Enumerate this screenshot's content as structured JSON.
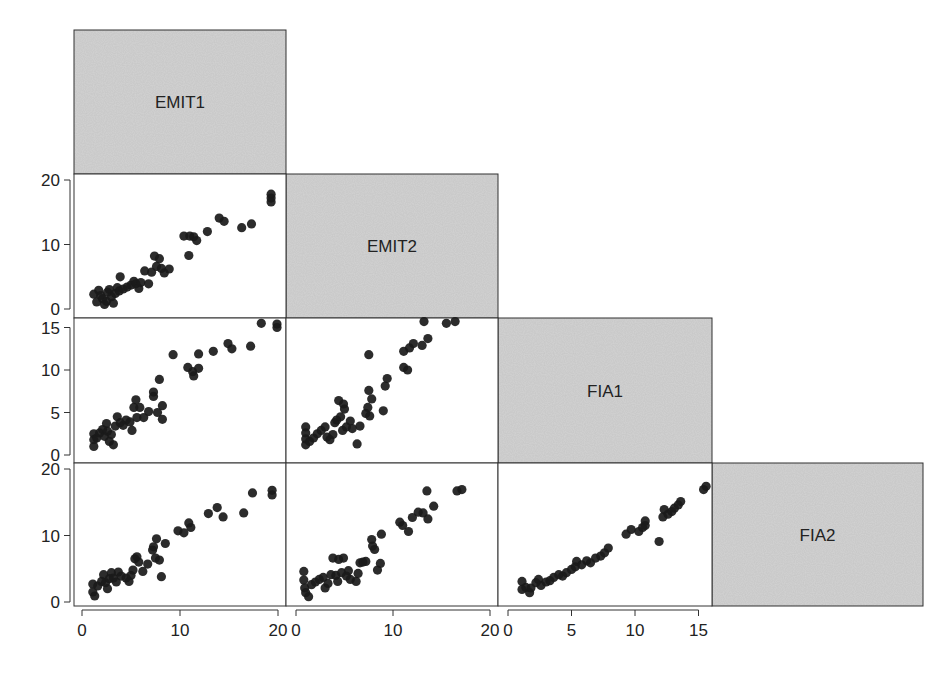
{
  "chart_data": {
    "type": "scatter",
    "title": "",
    "layout": "lower-triangular scatterplot matrix",
    "variables": [
      "EMIT1",
      "EMIT2",
      "FIA1",
      "FIA2"
    ],
    "diagonal_labels": [
      "EMIT1",
      "EMIT2",
      "FIA1",
      "FIA2"
    ],
    "colors": {
      "diagonal_fill": "#d4d4d4",
      "point": "#1a1a1a",
      "frame": "#333333"
    },
    "axes": {
      "EMIT1": {
        "range": [
          0,
          20
        ],
        "ticks": [
          0,
          10,
          20
        ]
      },
      "EMIT2": {
        "range": [
          0,
          20
        ],
        "ticks": [
          0,
          10,
          20
        ]
      },
      "FIA1": {
        "range": [
          0,
          15
        ],
        "ticks": [
          0,
          5,
          10,
          15
        ]
      },
      "FIA2": {
        "range": [
          0,
          20
        ],
        "ticks": [
          0,
          10,
          20
        ]
      }
    },
    "x_tick_labels": [
      [
        "0",
        "10",
        "20"
      ],
      [
        "0",
        "10",
        "20"
      ],
      [
        "0",
        "5",
        "10",
        "15"
      ]
    ],
    "y_tick_labels": [
      [
        "0",
        "10",
        "20"
      ],
      [
        "0",
        "5",
        "10",
        "15"
      ],
      [
        "0",
        "10",
        "20"
      ]
    ],
    "panels": [
      {
        "x": "EMIT1",
        "y": "EMIT2",
        "row": 1,
        "col": 0,
        "points": [
          [
            1.2,
            2.3
          ],
          [
            1.5,
            1.1
          ],
          [
            1.7,
            2.9
          ],
          [
            1.9,
            2.1
          ],
          [
            2.1,
            1.6
          ],
          [
            2.3,
            0.7
          ],
          [
            2.5,
            1.2
          ],
          [
            2.6,
            2.6
          ],
          [
            2.8,
            3.0
          ],
          [
            3.0,
            1.9
          ],
          [
            3.2,
            0.9
          ],
          [
            3.4,
            2.4
          ],
          [
            3.6,
            3.3
          ],
          [
            3.8,
            2.8
          ],
          [
            3.9,
            5.0
          ],
          [
            4.2,
            3.1
          ],
          [
            4.6,
            3.4
          ],
          [
            5.0,
            3.7
          ],
          [
            5.3,
            4.3
          ],
          [
            5.5,
            3.9
          ],
          [
            5.8,
            3.2
          ],
          [
            6.0,
            4.1
          ],
          [
            6.4,
            5.9
          ],
          [
            6.8,
            3.9
          ],
          [
            7.1,
            5.7
          ],
          [
            7.4,
            8.2
          ],
          [
            7.6,
            6.6
          ],
          [
            7.9,
            7.8
          ],
          [
            8.1,
            6.3
          ],
          [
            8.4,
            5.6
          ],
          [
            8.9,
            6.2
          ],
          [
            10.4,
            11.3
          ],
          [
            10.9,
            8.3
          ],
          [
            11.0,
            11.3
          ],
          [
            11.4,
            11.2
          ],
          [
            11.7,
            10.6
          ],
          [
            12.8,
            12.0
          ],
          [
            14.0,
            14.1
          ],
          [
            14.5,
            13.6
          ],
          [
            16.3,
            12.6
          ],
          [
            17.3,
            13.2
          ],
          [
            19.3,
            17.8
          ],
          [
            19.3,
            17.2
          ],
          [
            19.3,
            16.6
          ]
        ]
      },
      {
        "x": "EMIT1",
        "y": "FIA1",
        "row": 2,
        "col": 0,
        "points": [
          [
            1.2,
            2.5
          ],
          [
            1.2,
            1.8
          ],
          [
            1.2,
            1.0
          ],
          [
            1.5,
            2.0
          ],
          [
            1.8,
            2.6
          ],
          [
            2.1,
            3.0
          ],
          [
            2.3,
            2.2
          ],
          [
            2.5,
            3.7
          ],
          [
            2.6,
            2.8
          ],
          [
            2.8,
            1.6
          ],
          [
            3.0,
            2.4
          ],
          [
            3.2,
            1.2
          ],
          [
            3.4,
            3.4
          ],
          [
            3.6,
            4.5
          ],
          [
            3.9,
            3.8
          ],
          [
            4.2,
            3.5
          ],
          [
            4.5,
            4.1
          ],
          [
            4.9,
            3.9
          ],
          [
            5.1,
            2.9
          ],
          [
            5.3,
            5.6
          ],
          [
            5.5,
            6.5
          ],
          [
            5.6,
            4.4
          ],
          [
            5.9,
            5.6
          ],
          [
            6.3,
            4.4
          ],
          [
            6.8,
            5.1
          ],
          [
            7.3,
            7.4
          ],
          [
            7.3,
            6.9
          ],
          [
            7.7,
            5.0
          ],
          [
            7.9,
            8.9
          ],
          [
            8.2,
            5.8
          ],
          [
            8.2,
            4.2
          ],
          [
            9.3,
            11.8
          ],
          [
            10.8,
            10.3
          ],
          [
            11.3,
            9.8
          ],
          [
            11.4,
            9.3
          ],
          [
            11.9,
            11.9
          ],
          [
            11.9,
            10.2
          ],
          [
            13.4,
            12.2
          ],
          [
            14.9,
            13.1
          ],
          [
            15.3,
            12.5
          ],
          [
            17.2,
            12.8
          ],
          [
            18.3,
            15.5
          ],
          [
            19.9,
            15.4
          ],
          [
            19.9,
            15.0
          ]
        ]
      },
      {
        "x": "EMIT2",
        "y": "FIA1",
        "row": 2,
        "col": 1,
        "points": [
          [
            1.0,
            3.3
          ],
          [
            1.0,
            2.6
          ],
          [
            1.0,
            1.9
          ],
          [
            1.0,
            1.2
          ],
          [
            1.4,
            1.6
          ],
          [
            1.8,
            2.0
          ],
          [
            2.2,
            2.5
          ],
          [
            2.6,
            2.9
          ],
          [
            3.0,
            3.3
          ],
          [
            3.2,
            2.1
          ],
          [
            3.5,
            1.8
          ],
          [
            3.8,
            2.4
          ],
          [
            4.0,
            3.8
          ],
          [
            4.2,
            4.1
          ],
          [
            4.6,
            4.5
          ],
          [
            4.8,
            2.9
          ],
          [
            5.2,
            3.3
          ],
          [
            5.6,
            4.0
          ],
          [
            4.4,
            6.4
          ],
          [
            4.9,
            6.0
          ],
          [
            5.0,
            5.4
          ],
          [
            5.8,
            3.1
          ],
          [
            6.3,
            1.3
          ],
          [
            6.6,
            3.4
          ],
          [
            7.2,
            4.9
          ],
          [
            7.4,
            5.6
          ],
          [
            7.6,
            4.6
          ],
          [
            7.5,
            7.6
          ],
          [
            7.8,
            6.6
          ],
          [
            7.5,
            11.8
          ],
          [
            9.0,
            5.2
          ],
          [
            9.2,
            8.1
          ],
          [
            9.4,
            9.0
          ],
          [
            11.1,
            12.2
          ],
          [
            11.1,
            10.3
          ],
          [
            11.5,
            10.0
          ],
          [
            11.7,
            12.6
          ],
          [
            12.1,
            13.1
          ],
          [
            13.2,
            15.7
          ],
          [
            13.0,
            12.9
          ],
          [
            13.6,
            13.7
          ],
          [
            15.5,
            15.5
          ],
          [
            16.4,
            15.7
          ]
        ]
      },
      {
        "x": "EMIT1",
        "y": "FIA2",
        "row": 3,
        "col": 0,
        "points": [
          [
            1.1,
            2.7
          ],
          [
            1.1,
            1.5
          ],
          [
            1.3,
            0.9
          ],
          [
            1.6,
            2.4
          ],
          [
            2.0,
            3.1
          ],
          [
            2.2,
            4.1
          ],
          [
            2.4,
            2.9
          ],
          [
            2.6,
            2.0
          ],
          [
            2.8,
            3.5
          ],
          [
            3.0,
            4.4
          ],
          [
            3.2,
            3.6
          ],
          [
            3.5,
            3.0
          ],
          [
            3.7,
            4.5
          ],
          [
            4.0,
            3.9
          ],
          [
            4.5,
            3.6
          ],
          [
            4.8,
            3.1
          ],
          [
            5.0,
            4.0
          ],
          [
            5.2,
            4.8
          ],
          [
            5.4,
            6.5
          ],
          [
            5.6,
            6.8
          ],
          [
            5.8,
            6.0
          ],
          [
            6.2,
            4.6
          ],
          [
            6.7,
            5.7
          ],
          [
            7.2,
            7.8
          ],
          [
            7.3,
            8.3
          ],
          [
            7.5,
            6.6
          ],
          [
            7.6,
            9.5
          ],
          [
            7.9,
            6.3
          ],
          [
            8.1,
            3.8
          ],
          [
            8.5,
            8.8
          ],
          [
            9.8,
            10.7
          ],
          [
            10.4,
            10.4
          ],
          [
            10.9,
            11.9
          ],
          [
            11.1,
            11.2
          ],
          [
            12.9,
            13.3
          ],
          [
            13.8,
            14.2
          ],
          [
            14.4,
            12.8
          ],
          [
            16.5,
            13.4
          ],
          [
            17.4,
            16.4
          ],
          [
            19.4,
            16.8
          ],
          [
            19.4,
            16.1
          ]
        ]
      },
      {
        "x": "EMIT2",
        "y": "FIA2",
        "row": 3,
        "col": 1,
        "points": [
          [
            0.8,
            4.6
          ],
          [
            0.8,
            3.3
          ],
          [
            0.9,
            2.1
          ],
          [
            1.0,
            1.4
          ],
          [
            1.3,
            0.8
          ],
          [
            1.6,
            2.6
          ],
          [
            2.0,
            3.0
          ],
          [
            2.4,
            3.4
          ],
          [
            2.8,
            3.7
          ],
          [
            3.0,
            2.1
          ],
          [
            3.3,
            2.8
          ],
          [
            3.6,
            4.1
          ],
          [
            3.8,
            6.6
          ],
          [
            4.1,
            4.0
          ],
          [
            4.3,
            3.1
          ],
          [
            4.4,
            6.4
          ],
          [
            4.7,
            4.4
          ],
          [
            4.9,
            6.6
          ],
          [
            5.2,
            3.9
          ],
          [
            5.4,
            4.7
          ],
          [
            5.6,
            3.4
          ],
          [
            6.2,
            3.1
          ],
          [
            6.4,
            4.3
          ],
          [
            6.6,
            5.9
          ],
          [
            6.9,
            6.0
          ],
          [
            7.2,
            6.1
          ],
          [
            7.8,
            9.4
          ],
          [
            7.9,
            8.4
          ],
          [
            8.1,
            7.9
          ],
          [
            8.4,
            4.8
          ],
          [
            8.7,
            5.8
          ],
          [
            8.8,
            10.2
          ],
          [
            10.7,
            12.0
          ],
          [
            11.0,
            11.5
          ],
          [
            11.6,
            10.6
          ],
          [
            12.0,
            12.7
          ],
          [
            12.6,
            13.5
          ],
          [
            13.1,
            13.4
          ],
          [
            13.5,
            16.7
          ],
          [
            13.6,
            12.5
          ],
          [
            14.2,
            14.4
          ],
          [
            16.6,
            16.7
          ],
          [
            17.1,
            16.9
          ]
        ]
      },
      {
        "x": "FIA1",
        "y": "FIA2",
        "row": 3,
        "col": 2,
        "points": [
          [
            1.1,
            3.1
          ],
          [
            1.1,
            1.9
          ],
          [
            1.4,
            2.2
          ],
          [
            1.7,
            1.4
          ],
          [
            1.8,
            2.1
          ],
          [
            2.2,
            2.9
          ],
          [
            2.4,
            3.4
          ],
          [
            2.6,
            2.5
          ],
          [
            3.0,
            3.0
          ],
          [
            3.3,
            3.2
          ],
          [
            3.6,
            3.7
          ],
          [
            4.0,
            4.1
          ],
          [
            4.3,
            3.9
          ],
          [
            4.6,
            4.4
          ],
          [
            5.0,
            4.9
          ],
          [
            5.3,
            5.3
          ],
          [
            5.4,
            6.1
          ],
          [
            5.8,
            5.6
          ],
          [
            6.2,
            6.2
          ],
          [
            6.5,
            5.9
          ],
          [
            6.9,
            6.6
          ],
          [
            7.3,
            6.9
          ],
          [
            7.6,
            7.4
          ],
          [
            7.9,
            8.1
          ],
          [
            9.3,
            10.2
          ],
          [
            9.7,
            10.9
          ],
          [
            10.3,
            10.6
          ],
          [
            10.6,
            11.2
          ],
          [
            10.8,
            12.2
          ],
          [
            10.8,
            11.5
          ],
          [
            11.9,
            9.1
          ],
          [
            12.2,
            12.8
          ],
          [
            12.3,
            13.9
          ],
          [
            12.6,
            13.2
          ],
          [
            12.9,
            13.6
          ],
          [
            13.1,
            14.1
          ],
          [
            13.4,
            14.6
          ],
          [
            13.6,
            15.1
          ],
          [
            15.4,
            16.9
          ],
          [
            15.6,
            17.4
          ]
        ]
      }
    ]
  }
}
